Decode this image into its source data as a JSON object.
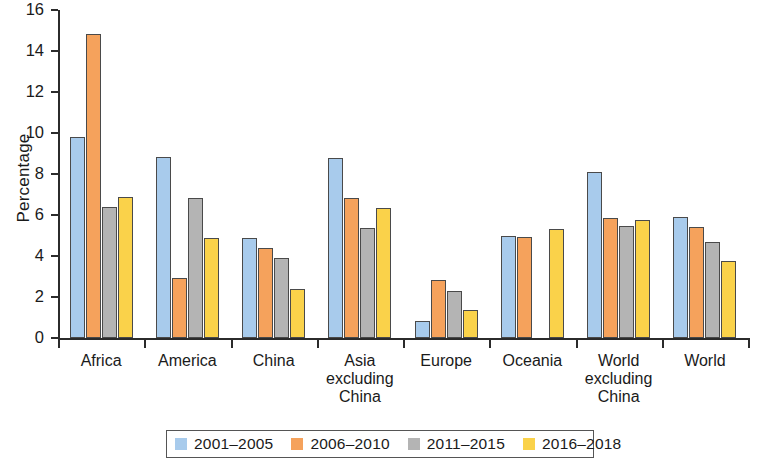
{
  "chart_data": {
    "type": "bar",
    "title": "",
    "xlabel": "",
    "ylabel": "Percentage",
    "ylim": [
      0,
      16
    ],
    "yticks": [
      0,
      2,
      4,
      6,
      8,
      10,
      12,
      14,
      16
    ],
    "grid": false,
    "legend_position": "bottom",
    "categories": [
      "Africa",
      "America",
      "China",
      "Asia excluding China",
      "Europe",
      "Oceania",
      "World excluding China",
      "World"
    ],
    "category_label_lines": [
      [
        "Africa"
      ],
      [
        "America"
      ],
      [
        "China"
      ],
      [
        "Asia",
        "excluding",
        "China"
      ],
      [
        "Europe"
      ],
      [
        "Oceania"
      ],
      [
        "World",
        "excluding",
        "China"
      ],
      [
        "World"
      ]
    ],
    "series": [
      {
        "name": "2001–2005",
        "color": "#a8cbec",
        "values": [
          9.8,
          8.85,
          4.9,
          8.8,
          0.85,
          5.0,
          8.1,
          5.9
        ]
      },
      {
        "name": "2006–2010",
        "color": "#f5a25c",
        "values": [
          14.85,
          2.95,
          4.4,
          6.85,
          2.85,
          4.95,
          5.85,
          5.4
        ]
      },
      {
        "name": "2011–2015",
        "color": "#b4b4b4",
        "values": [
          6.4,
          6.85,
          3.9,
          5.35,
          2.3,
          null,
          5.45,
          4.7
        ]
      },
      {
        "name": "2016–2018",
        "color": "#fad24a",
        "values": [
          6.9,
          4.9,
          2.4,
          6.35,
          1.35,
          5.3,
          5.75,
          3.75
        ]
      }
    ]
  },
  "legend": {
    "items": [
      {
        "label": "2001–2005",
        "color": "#a8cbec"
      },
      {
        "label": "2006–2010",
        "color": "#f5a25c"
      },
      {
        "label": "2011–2015",
        "color": "#b4b4b4"
      },
      {
        "label": "2016–2018",
        "color": "#fad24a"
      }
    ]
  }
}
